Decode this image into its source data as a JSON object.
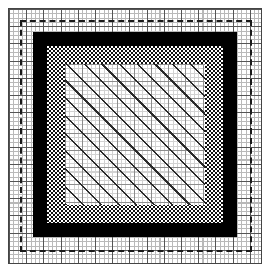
{
  "figure": {
    "title": "Concentric rectangular pattern diagram",
    "width_px": 269,
    "height_px": 276,
    "background_color": "#ffffff"
  },
  "layers": [
    {
      "id": "outer-grid",
      "name": "outer-graph-grid",
      "kind": "grid",
      "left_px": 8,
      "top_px": 8,
      "width_px": 254,
      "height_px": 256,
      "minor_spacing_px": 4.3,
      "major_spacing_px": 17.2,
      "minor_color": "#b9b9b9",
      "major_color": "#555555",
      "border_color": "#444444",
      "fill_color": "#ffffff"
    },
    {
      "id": "dashed-rect",
      "name": "dashed-outline-rectangle",
      "kind": "dashed-border",
      "left_px": 20,
      "top_px": 20,
      "width_px": 232,
      "height_px": 232,
      "stroke_width_px": 2,
      "stroke_color": "#1a1a1a",
      "stroke_style": "dashed"
    },
    {
      "id": "black-frame",
      "name": "solid-black-frame",
      "kind": "solid-border",
      "left_px": 33,
      "top_px": 32,
      "width_px": 204,
      "height_px": 205,
      "thickness_px": 14,
      "color": "#000000"
    },
    {
      "id": "checker-band",
      "name": "checkerboard-band",
      "kind": "checkerboard",
      "left_px": 47,
      "top_px": 46,
      "width_px": 176,
      "height_px": 177,
      "cell_px": 2,
      "dark_color": "#101010",
      "light_color": "#ffffff",
      "band_thickness_px": 18
    },
    {
      "id": "hatch-interior",
      "name": "diagonal-hatch-panel",
      "kind": "hatch",
      "left_px": 65,
      "top_px": 64,
      "width_px": 140,
      "height_px": 141,
      "hatch_angle_deg": 45,
      "hatch_spacing_px": 12.5,
      "hatch_line_width_px": 1.6,
      "hatch_color": "#2a2a2a",
      "grid_minor_spacing_px": 4.3,
      "grid_major_spacing_px": 17.2,
      "grid_minor_color": "#d2d2d2",
      "grid_major_color": "#8d8d8d",
      "fill_color": "#ffffff"
    }
  ],
  "palette": {
    "black": "#000000",
    "near_black": "#101010",
    "dark_gray": "#2a2a2a",
    "mid_gray": "#555555",
    "grid_gray": "#8d8d8d",
    "light_gray": "#b9b9b9",
    "pale_gray": "#d2d2d2",
    "white": "#ffffff"
  }
}
